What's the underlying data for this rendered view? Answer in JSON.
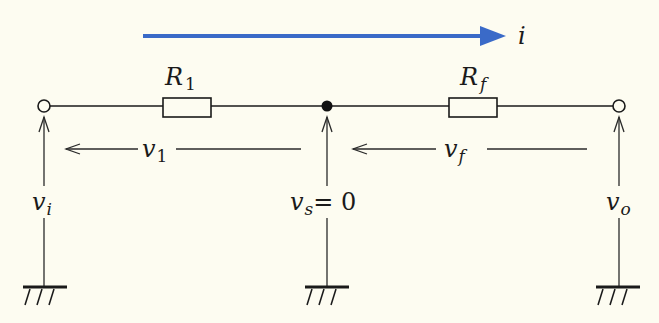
{
  "diagram": {
    "current": {
      "label": "i",
      "color": "#3a6ac8"
    },
    "components": [
      {
        "id": "R1",
        "label": "R",
        "sub": "1"
      },
      {
        "id": "Rf",
        "label": "R",
        "sub": "f"
      }
    ],
    "voltages": {
      "v1": {
        "label": "v",
        "sub": "1"
      },
      "vf": {
        "label": "v",
        "sub": "f"
      },
      "vi": {
        "label": "v",
        "sub": "i"
      },
      "vs": {
        "label": "v",
        "sub": "s",
        "eq": "= 0"
      },
      "vo": {
        "label": "v",
        "sub": "o"
      }
    }
  }
}
